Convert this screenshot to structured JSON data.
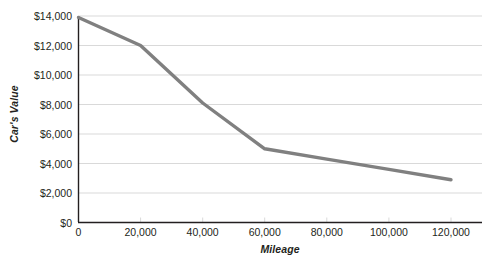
{
  "chart_data": {
    "type": "line",
    "title": "",
    "xlabel": "Mileage",
    "ylabel": "Car's Value",
    "x": [
      0,
      20000,
      40000,
      60000,
      80000,
      100000,
      120000
    ],
    "values": [
      13900,
      12000,
      8100,
      5000,
      4300,
      3600,
      2900
    ],
    "series": [
      {
        "name": "Car's Value",
        "values": [
          13900,
          12000,
          8100,
          5000,
          4300,
          3600,
          2900
        ]
      }
    ],
    "xlim": [
      0,
      130000
    ],
    "ylim": [
      0,
      14000
    ],
    "x_tick_labels": [
      "0",
      "20,000",
      "40,000",
      "60,000",
      "80,000",
      "100,000",
      "120,000"
    ],
    "y_tick_labels": [
      "$0",
      "$2,000",
      "$4,000",
      "$6,000",
      "$8,000",
      "$10,000",
      "$12,000",
      "$14,000"
    ],
    "y_tick_values": [
      0,
      2000,
      4000,
      6000,
      8000,
      10000,
      12000,
      14000
    ],
    "grid": "horizontal",
    "legend": "none",
    "line_color": "#808080",
    "grid_color": "#d9d9d9",
    "axis_color": "#231f20",
    "text_color": "#231f20",
    "background": "#ffffff"
  }
}
